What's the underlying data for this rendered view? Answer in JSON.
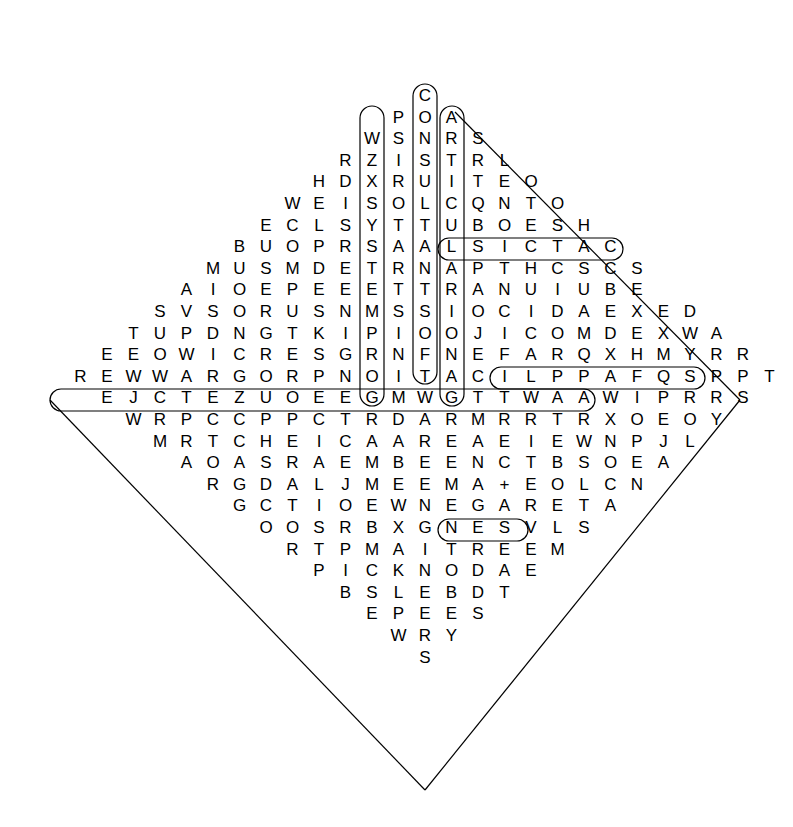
{
  "puzzle": {
    "type": "word-search",
    "shape": "diamond",
    "origin": {
      "x": 425,
      "y": 96
    },
    "col_step": 26.5,
    "row_step": 21.6,
    "rows": [
      {
        "start": 0,
        "letters": "C"
      },
      {
        "start": -2,
        "letters": "P O A"
      },
      {
        "start": -4,
        "letters": "W S N R S"
      },
      {
        "start": -6,
        "letters": "R Z I S T R L"
      },
      {
        "start": -8,
        "letters": "H D X R U I T E O"
      },
      {
        "start": -10,
        "letters": "W E I S O L C Q N T O"
      },
      {
        "start": -12,
        "letters": "E C L S Y T T U B O E S H"
      },
      {
        "start": -14,
        "letters": "B U O P R S A A L S I C T A C"
      },
      {
        "start": -16,
        "letters": "M U S M D E T R N A P T H C S C S"
      },
      {
        "start": -18,
        "letters": "A I O E P E E E T T R A N U I U B E"
      },
      {
        "start": -20,
        "letters": "S V S O R U S N M S S I O C I D A E X E D"
      },
      {
        "start": -22,
        "letters": "T U P D N G T K I P I O O J I C O M D E X W A"
      },
      {
        "start": -24,
        "letters": "E E O W I C R E S G R N F N E F A R Q X H M Y R R"
      },
      {
        "start": -26,
        "letters": "R E W W A R G O R P N O I T A C I L P P A F Q S P P T"
      },
      {
        "start": -24,
        "letters": "E J C T E Z U O E E G M W G T T W A A W I P R R S"
      },
      {
        "start": -22,
        "letters": "W R P C C P P C T R D A R M R R T R X O E O Y"
      },
      {
        "start": -20,
        "letters": "M R T C H E I C A A R E A E I E W N P J L"
      },
      {
        "start": -18,
        "letters": "A O A S R A E M B E E N C T B S O E A"
      },
      {
        "start": -16,
        "letters": "R G D A L J M E E M A + E O L C N"
      },
      {
        "start": -14,
        "letters": "G C T I O E W N E G A R E T A"
      },
      {
        "start": -12,
        "letters": "O O S R B X G N E S V L S"
      },
      {
        "start": -10,
        "letters": "R T P M A I T R E E M"
      },
      {
        "start": -8,
        "letters": "P I C K N O D A E"
      },
      {
        "start": -6,
        "letters": "B S L E B D T"
      },
      {
        "start": -4,
        "letters": "E P E E S"
      },
      {
        "start": -2,
        "letters": "W R Y"
      },
      {
        "start": 0,
        "letters": "S"
      }
    ],
    "found_words_visible": [
      "CONSTRUCTION",
      "COMDEX",
      "APPLICATION",
      "ENC",
      "SICTAC"
    ]
  }
}
